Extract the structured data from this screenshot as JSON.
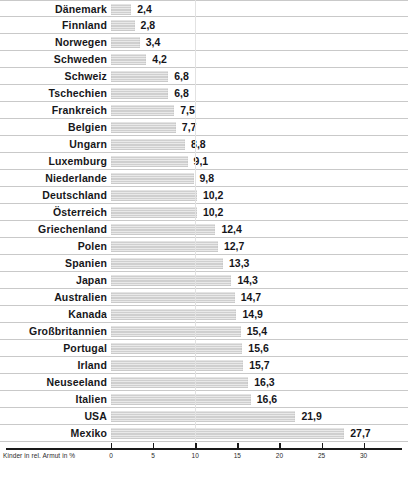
{
  "chart_data": {
    "type": "bar",
    "orientation": "horizontal",
    "title": "",
    "xlabel": "Kinder in rel. Armut in %",
    "ylabel": "",
    "xlim": [
      0,
      30
    ],
    "xticks": [
      0,
      5,
      10,
      15,
      20,
      25,
      30
    ],
    "xtick_labels": [
      "0",
      "5",
      "10",
      "15",
      "20",
      "25",
      "30"
    ],
    "grid": "vertical gridline at 10",
    "legend": "none",
    "decimal_separator": ",",
    "bar_color": "#cfcfcf",
    "separator_color": "#c9c9c9",
    "axis_color": "#1a1a1a",
    "categories": [
      "Dänemark",
      "Finnland",
      "Norwegen",
      "Schweden",
      "Schweiz",
      "Tschechien",
      "Frankreich",
      "Belgien",
      "Ungarn",
      "Luxemburg",
      "Niederlande",
      "Deutschland",
      "Österreich",
      "Griechenland",
      "Polen",
      "Spanien",
      "Japan",
      "Australien",
      "Kanada",
      "Großbritannien",
      "Portugal",
      "Irland",
      "Neuseeland",
      "Italien",
      "USA",
      "Mexiko"
    ],
    "values": [
      2.4,
      2.8,
      3.4,
      4.2,
      6.8,
      6.8,
      7.5,
      7.7,
      8.8,
      9.1,
      9.8,
      10.2,
      10.2,
      12.4,
      12.7,
      13.3,
      14.3,
      14.7,
      14.9,
      15.4,
      15.6,
      15.7,
      16.3,
      16.6,
      21.9,
      27.7
    ],
    "value_labels": [
      "2,4",
      "2,8",
      "3,4",
      "4,2",
      "6,8",
      "6,8",
      "7,5",
      "7,7",
      "8,8",
      "9,1",
      "9,8",
      "10,2",
      "10,2",
      "12,4",
      "12,7",
      "13,3",
      "14,3",
      "14,7",
      "14,9",
      "15,4",
      "15,6",
      "15,7",
      "16,3",
      "16,6",
      "21,9",
      "27,7"
    ]
  }
}
